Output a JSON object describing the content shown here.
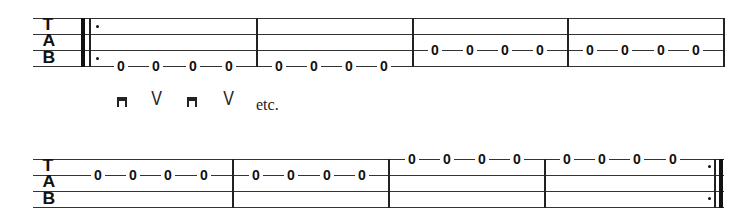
{
  "clef": {
    "t": "T",
    "a": "A",
    "b": "B"
  },
  "system1": {
    "measures": [
      {
        "string": 4,
        "notes": [
          "0",
          "0",
          "0",
          "0"
        ]
      },
      {
        "string": 4,
        "notes": [
          "0",
          "0",
          "0",
          "0"
        ]
      },
      {
        "string": 3,
        "notes": [
          "0",
          "0",
          "0",
          "0"
        ]
      },
      {
        "string": 3,
        "notes": [
          "0",
          "0",
          "0",
          "0"
        ]
      }
    ]
  },
  "strokes": {
    "symbols": [
      "downstroke",
      "upstroke",
      "downstroke",
      "upstroke"
    ],
    "up_glyph": "V",
    "etc_label": "etc."
  },
  "system2": {
    "measures": [
      {
        "string": 2,
        "notes": [
          "0",
          "0",
          "0",
          "0"
        ]
      },
      {
        "string": 2,
        "notes": [
          "0",
          "0",
          "0",
          "0"
        ]
      },
      {
        "string": 1,
        "notes": [
          "0",
          "0",
          "0",
          "0"
        ]
      },
      {
        "string": 1,
        "notes": [
          "0",
          "0",
          "0",
          "0"
        ]
      }
    ]
  }
}
